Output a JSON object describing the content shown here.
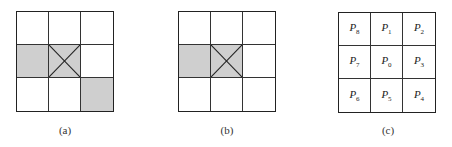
{
  "figures": [
    {
      "id": "a",
      "caption": "(a)",
      "cells": [
        {
          "shaded": false,
          "cross": false
        },
        {
          "shaded": false,
          "cross": false
        },
        {
          "shaded": false,
          "cross": false
        },
        {
          "shaded": true,
          "cross": false
        },
        {
          "shaded": true,
          "cross": true
        },
        {
          "shaded": false,
          "cross": false
        },
        {
          "shaded": false,
          "cross": false
        },
        {
          "shaded": false,
          "cross": false
        },
        {
          "shaded": true,
          "cross": false
        }
      ]
    },
    {
      "id": "b",
      "caption": "(b)",
      "cells": [
        {
          "shaded": false,
          "cross": false
        },
        {
          "shaded": false,
          "cross": false
        },
        {
          "shaded": false,
          "cross": false
        },
        {
          "shaded": true,
          "cross": false
        },
        {
          "shaded": true,
          "cross": true
        },
        {
          "shaded": false,
          "cross": false
        },
        {
          "shaded": false,
          "cross": false
        },
        {
          "shaded": false,
          "cross": false
        },
        {
          "shaded": false,
          "cross": false
        }
      ]
    },
    {
      "id": "c",
      "caption": "(c)",
      "labels": [
        {
          "base": "P",
          "sub": "8"
        },
        {
          "base": "P",
          "sub": "1"
        },
        {
          "base": "P",
          "sub": "2"
        },
        {
          "base": "P",
          "sub": "7"
        },
        {
          "base": "P",
          "sub": "0"
        },
        {
          "base": "P",
          "sub": "3"
        },
        {
          "base": "P",
          "sub": "6"
        },
        {
          "base": "P",
          "sub": "5"
        },
        {
          "base": "P",
          "sub": "4"
        }
      ]
    }
  ],
  "colors": {
    "shade": "#cfcfcf",
    "line": "#222222"
  }
}
